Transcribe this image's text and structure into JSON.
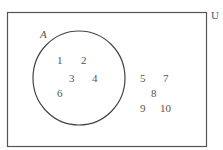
{
  "diagram": {
    "type": "venn",
    "universe_label": "U",
    "set_label": "A",
    "set_A_elements": [
      "1",
      "2",
      "3",
      "4",
      "6"
    ],
    "outside_elements": [
      "5",
      "7",
      "8",
      "9",
      "10"
    ],
    "colors": {
      "stroke": "#444444",
      "text": "#555555",
      "background": "#ffffff"
    }
  }
}
